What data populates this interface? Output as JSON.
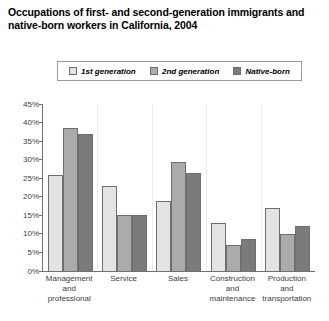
{
  "title": {
    "line1": "Occupations of first- and second-generation immigrants and",
    "line2": "native-born workers in California, 2004"
  },
  "legend": {
    "position": "top",
    "items": [
      {
        "label": "1st generation",
        "color": "#e3e3e3"
      },
      {
        "label": "2nd generation",
        "color": "#ababab"
      },
      {
        "label": "Native-born",
        "color": "#7b7b7b"
      }
    ]
  },
  "chart_data": {
    "type": "bar",
    "title": "Occupations of first- and second-generation immigrants and native-born workers in California, 2004",
    "xlabel": "",
    "ylabel": "",
    "ylim": [
      0,
      45
    ],
    "ytick_labels": [
      "45%",
      "40%",
      "35%",
      "30%",
      "25%",
      "20%",
      "15%",
      "10%",
      "5%",
      "0%"
    ],
    "ytick_values": [
      45,
      40,
      35,
      30,
      25,
      20,
      15,
      10,
      5,
      0
    ],
    "grid": false,
    "legend_position": "top",
    "categories": [
      "Management and professional",
      "Service",
      "Sales",
      "Construction and maintenance",
      "Production and transportation"
    ],
    "category_lines": [
      [
        "Management",
        "and",
        "professional"
      ],
      [
        "Service"
      ],
      [
        "Sales"
      ],
      [
        "Construction",
        "and",
        "maintenance"
      ],
      [
        "Production",
        "and",
        "transportation"
      ]
    ],
    "series": [
      {
        "name": "1st generation",
        "color": "#e3e3e3",
        "values": [
          26,
          23,
          19,
          13,
          17
        ]
      },
      {
        "name": "2nd generation",
        "color": "#ababab",
        "values": [
          38.5,
          15,
          29.5,
          7,
          10
        ]
      },
      {
        "name": "Native-born",
        "color": "#7b7b7b",
        "values": [
          37,
          15,
          26.5,
          8.5,
          12
        ]
      }
    ]
  }
}
